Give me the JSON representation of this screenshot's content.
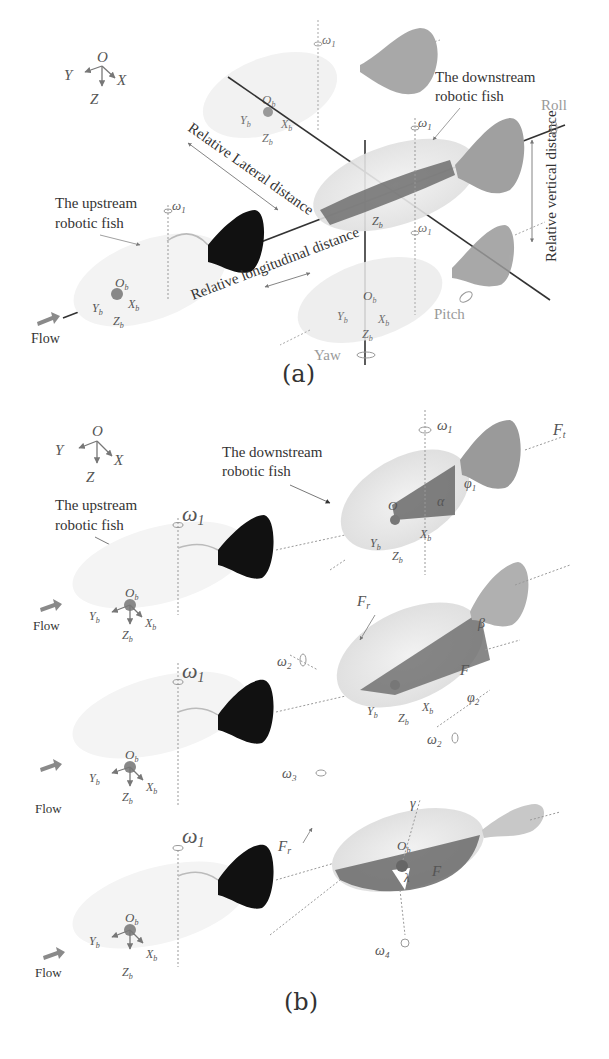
{
  "panel_a": {
    "caption": "(a)",
    "global_frame": {
      "origin": "O",
      "x": "X",
      "y": "Y",
      "z": "Z"
    },
    "body_frame": {
      "origin": "O",
      "origin_sub": "b",
      "x": "X",
      "x_sub": "b",
      "y": "Y",
      "y_sub": "b",
      "z": "Z",
      "z_sub": "b"
    },
    "labels": {
      "upstream_line1": "The upstream",
      "upstream_line2": "robotic fish",
      "downstream_line1": "The downstream",
      "downstream_line2": "robotic fish",
      "lateral": "Relative Lateral distance",
      "longitudinal": "Relative longitudinal distance",
      "vertical": "Relative vertical distance",
      "roll": "Roll",
      "pitch": "Pitch",
      "yaw": "Yaw",
      "flow": "Flow",
      "omega": "ω",
      "omega_sub": "1"
    }
  },
  "panel_b": {
    "caption": "(b)",
    "global_frame": {
      "origin": "O",
      "x": "X",
      "y": "Y",
      "z": "Z"
    },
    "labels": {
      "upstream_line1": "The upstream",
      "upstream_line2": "robotic fish",
      "downstream_line1": "The downstream",
      "downstream_line2": "robotic fish",
      "flow": "Flow",
      "omega": "ω",
      "omega1_sub": "1",
      "omega2_sub": "2",
      "omega3_sub": "3",
      "omega4_sub": "4",
      "F": "F",
      "Ft_sub": "t",
      "Fr_sub": "r",
      "alpha": "α",
      "beta": "β",
      "gamma": "γ",
      "lambda": "λ",
      "phi": "φ",
      "phi1_sub": "1",
      "phi2_sub": "2",
      "Ob": "O",
      "b_sub": "b",
      "Xb": "X",
      "Yb": "Y",
      "Zb": "Z"
    }
  },
  "colors": {
    "upstream_fin": "#111111",
    "downstream_fin": "#8c8c8c",
    "fish_body": "#e6e6e6",
    "shade": "#6e6e6e",
    "flow_arrow": "#8a8a8a"
  }
}
